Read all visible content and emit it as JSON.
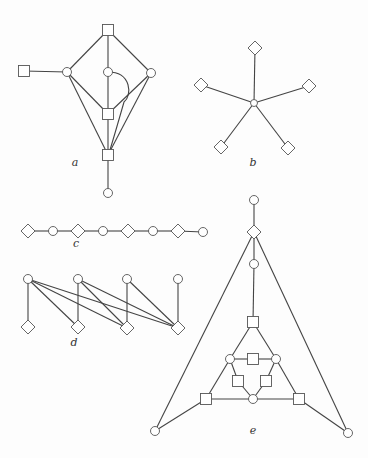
{
  "figure": {
    "width": 368,
    "height": 458,
    "colors": {
      "edge": "#444444",
      "node_stroke": "#555555",
      "node_fill": "#ffffff",
      "label": "#333333"
    },
    "graphs": [
      {
        "id": "a",
        "label": "a",
        "label_pos": [
          75,
          166
        ],
        "nodes": [
          {
            "id": "a_top",
            "shape": "square",
            "x": 108,
            "y": 30
          },
          {
            "id": "a_lsq",
            "shape": "square",
            "x": 24,
            "y": 71
          },
          {
            "id": "a_lc",
            "shape": "circle",
            "x": 67,
            "y": 72
          },
          {
            "id": "a_cc",
            "shape": "circle",
            "x": 108,
            "y": 72
          },
          {
            "id": "a_rc",
            "shape": "circle",
            "x": 151,
            "y": 73
          },
          {
            "id": "a_msq",
            "shape": "square",
            "x": 108,
            "y": 114
          },
          {
            "id": "a_bsq",
            "shape": "square",
            "x": 108,
            "y": 155
          },
          {
            "id": "a_bc",
            "shape": "circle",
            "x": 108,
            "y": 193
          }
        ],
        "edges": [
          [
            "a_top",
            "a_lc"
          ],
          [
            "a_top",
            "a_cc"
          ],
          [
            "a_top",
            "a_rc"
          ],
          [
            "a_lsq",
            "a_lc"
          ],
          [
            "a_lc",
            "a_msq"
          ],
          [
            "a_lc",
            "a_bsq"
          ],
          [
            "a_cc",
            "a_msq"
          ],
          [
            "a_rc",
            "a_msq"
          ],
          [
            "a_rc",
            "a_bsq"
          ],
          [
            "a_msq",
            "a_bsq"
          ],
          [
            "a_bsq",
            "a_bc"
          ]
        ],
        "curves": [
          {
            "path": "M108,72 C132,72 132,96 124,102 Q116,130 110,150"
          }
        ]
      },
      {
        "id": "b",
        "label": "b",
        "label_pos": [
          253,
          166
        ],
        "nodes": [
          {
            "id": "b_c",
            "shape": "circle",
            "x": 254,
            "y": 103,
            "r": 3.5
          },
          {
            "id": "b_t",
            "shape": "diamond",
            "x": 255,
            "y": 48
          },
          {
            "id": "b_l",
            "shape": "diamond",
            "x": 201,
            "y": 85
          },
          {
            "id": "b_r",
            "shape": "diamond",
            "x": 309,
            "y": 86
          },
          {
            "id": "b_bl",
            "shape": "diamond",
            "x": 221,
            "y": 147
          },
          {
            "id": "b_br",
            "shape": "diamond",
            "x": 288,
            "y": 148
          }
        ],
        "edges": [
          [
            "b_c",
            "b_t"
          ],
          [
            "b_c",
            "b_l"
          ],
          [
            "b_c",
            "b_r"
          ],
          [
            "b_c",
            "b_bl"
          ],
          [
            "b_c",
            "b_br"
          ]
        ],
        "curves": []
      },
      {
        "id": "c",
        "label": "c",
        "label_pos": [
          76,
          247
        ],
        "nodes": [
          {
            "id": "c1",
            "shape": "diamond",
            "x": 28,
            "y": 231
          },
          {
            "id": "c2",
            "shape": "circle",
            "x": 53,
            "y": 231
          },
          {
            "id": "c3",
            "shape": "diamond",
            "x": 78,
            "y": 231
          },
          {
            "id": "c4",
            "shape": "circle",
            "x": 103,
            "y": 231
          },
          {
            "id": "c5",
            "shape": "diamond",
            "x": 128,
            "y": 231
          },
          {
            "id": "c6",
            "shape": "circle",
            "x": 153,
            "y": 231
          },
          {
            "id": "c7",
            "shape": "diamond",
            "x": 178,
            "y": 231
          },
          {
            "id": "c8",
            "shape": "circle",
            "x": 203,
            "y": 232
          }
        ],
        "edges": [
          [
            "c1",
            "c2"
          ],
          [
            "c2",
            "c3"
          ],
          [
            "c3",
            "c4"
          ],
          [
            "c4",
            "c5"
          ],
          [
            "c5",
            "c6"
          ],
          [
            "c6",
            "c7"
          ],
          [
            "c7",
            "c8"
          ]
        ],
        "curves": []
      },
      {
        "id": "d",
        "label": "d",
        "label_pos": [
          74,
          346
        ],
        "nodes": [
          {
            "id": "d_t1",
            "shape": "circle",
            "x": 28,
            "y": 279
          },
          {
            "id": "d_t2",
            "shape": "circle",
            "x": 78,
            "y": 279
          },
          {
            "id": "d_t3",
            "shape": "circle",
            "x": 127,
            "y": 279
          },
          {
            "id": "d_t4",
            "shape": "circle",
            "x": 178,
            "y": 279
          },
          {
            "id": "d_b1",
            "shape": "diamond",
            "x": 28,
            "y": 327
          },
          {
            "id": "d_b2",
            "shape": "diamond",
            "x": 78,
            "y": 327
          },
          {
            "id": "d_b3",
            "shape": "diamond",
            "x": 127,
            "y": 328
          },
          {
            "id": "d_b4",
            "shape": "diamond",
            "x": 178,
            "y": 328
          }
        ],
        "edges": [
          [
            "d_t1",
            "d_b1"
          ],
          [
            "d_t1",
            "d_b2"
          ],
          [
            "d_t1",
            "d_b3"
          ],
          [
            "d_t1",
            "d_b4"
          ],
          [
            "d_t2",
            "d_b2"
          ],
          [
            "d_t2",
            "d_b3"
          ],
          [
            "d_t2",
            "d_b4"
          ],
          [
            "d_t3",
            "d_b3"
          ],
          [
            "d_t3",
            "d_b4"
          ],
          [
            "d_t4",
            "d_b4"
          ]
        ],
        "curves": []
      },
      {
        "id": "e",
        "label": "e",
        "label_pos": [
          253,
          434
        ],
        "nodes": [
          {
            "id": "e_top",
            "shape": "circle",
            "x": 254,
            "y": 200
          },
          {
            "id": "e_dia",
            "shape": "diamond",
            "x": 254,
            "y": 232
          },
          {
            "id": "e_c2",
            "shape": "circle",
            "x": 254,
            "y": 264
          },
          {
            "id": "e_sq1",
            "shape": "square",
            "x": 253,
            "y": 322
          },
          {
            "id": "e_lc",
            "shape": "circle",
            "x": 230,
            "y": 359
          },
          {
            "id": "e_msq",
            "shape": "square",
            "x": 253,
            "y": 359
          },
          {
            "id": "e_rc",
            "shape": "circle",
            "x": 276,
            "y": 359
          },
          {
            "id": "e_lsm",
            "shape": "square",
            "x": 238,
            "y": 381
          },
          {
            "id": "e_rsm",
            "shape": "square",
            "x": 266,
            "y": 381
          },
          {
            "id": "e_bc",
            "shape": "circle",
            "x": 253,
            "y": 399
          },
          {
            "id": "e_bl",
            "shape": "square",
            "x": 206,
            "y": 399
          },
          {
            "id": "e_br",
            "shape": "square",
            "x": 299,
            "y": 399
          },
          {
            "id": "e_fl",
            "shape": "circle",
            "x": 155,
            "y": 431
          },
          {
            "id": "e_fr",
            "shape": "circle",
            "x": 348,
            "y": 433
          }
        ],
        "edges": [
          [
            "e_top",
            "e_dia"
          ],
          [
            "e_dia",
            "e_c2"
          ],
          [
            "e_c2",
            "e_sq1"
          ],
          [
            "e_dia",
            "e_fl"
          ],
          [
            "e_dia",
            "e_fr"
          ],
          [
            "e_sq1",
            "e_lc"
          ],
          [
            "e_sq1",
            "e_rc"
          ],
          [
            "e_lc",
            "e_msq"
          ],
          [
            "e_msq",
            "e_rc"
          ],
          [
            "e_lc",
            "e_lsm"
          ],
          [
            "e_lsm",
            "e_bc"
          ],
          [
            "e_rc",
            "e_rsm"
          ],
          [
            "e_rsm",
            "e_bc"
          ],
          [
            "e_lc",
            "e_bl"
          ],
          [
            "e_rc",
            "e_br"
          ],
          [
            "e_bl",
            "e_bc"
          ],
          [
            "e_bc",
            "e_br"
          ],
          [
            "e_bl",
            "e_fl"
          ],
          [
            "e_br",
            "e_fr"
          ]
        ],
        "curves": []
      }
    ]
  }
}
